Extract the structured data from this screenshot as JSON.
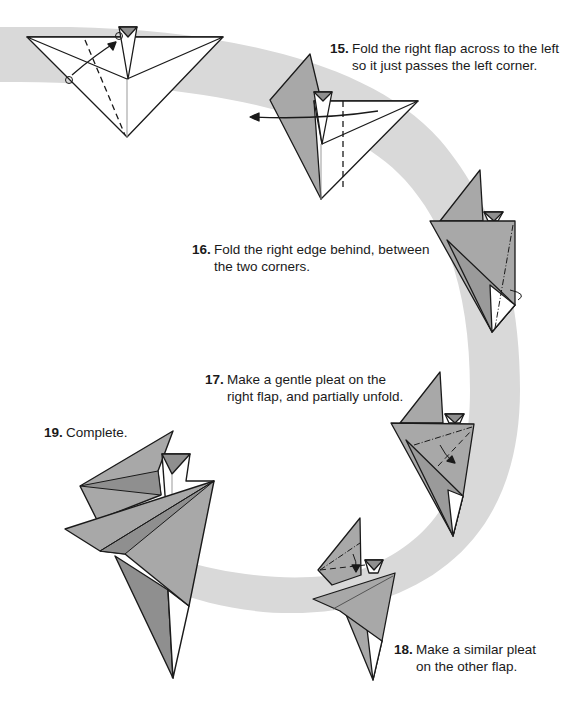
{
  "colors": {
    "band": "#d9d9d9",
    "paper_gray": "#a8a8a8",
    "paper_dark": "#8f8f8f",
    "paper_white": "#ffffff",
    "stroke": "#1a1a1a"
  },
  "steps": [
    {
      "number": "15.",
      "lines": [
        "Fold the right flap across to the left",
        "so it just passes the left corner."
      ]
    },
    {
      "number": "16.",
      "lines": [
        "Fold the right edge behind, between",
        "the two corners."
      ]
    },
    {
      "number": "17.",
      "lines": [
        "Make a gentle pleat on the",
        "right flap, and partially unfold."
      ]
    },
    {
      "number": "18.",
      "lines": [
        "Make a similar pleat",
        "on the other flap."
      ]
    },
    {
      "number": "19.",
      "lines": [
        "Complete."
      ]
    }
  ],
  "diagrams": [
    {
      "id": "step-14",
      "label": "previous-step-diagram"
    },
    {
      "id": "step-15",
      "label": "step-15-diagram"
    },
    {
      "id": "step-16",
      "label": "step-16-diagram"
    },
    {
      "id": "step-17",
      "label": "step-17-diagram"
    },
    {
      "id": "step-18",
      "label": "step-18-diagram"
    },
    {
      "id": "step-19",
      "label": "step-19-diagram"
    }
  ]
}
